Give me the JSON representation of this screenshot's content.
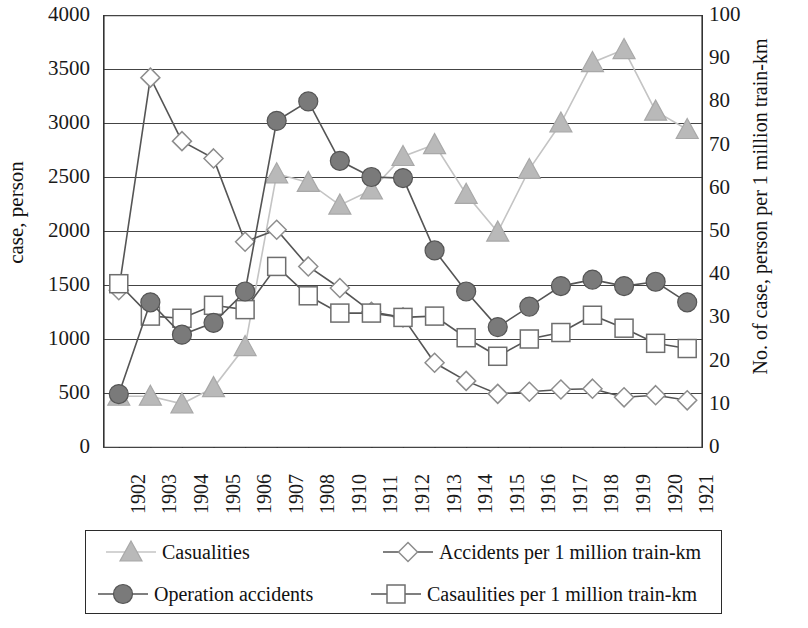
{
  "chart_data": {
    "type": "line",
    "title": "",
    "subtitle": "",
    "ylabel": "case, person",
    "y2label": "No. of case, person per 1 million train-km",
    "xlabel": "",
    "grid": true,
    "legend_position": "bottom",
    "ylim": [
      0,
      4000
    ],
    "y2lim": [
      0,
      100
    ],
    "yticks": [
      "0",
      "500",
      "1000",
      "1500",
      "2000",
      "2500",
      "3000",
      "3500",
      "4000"
    ],
    "ytick_values": [
      0,
      500,
      1000,
      1500,
      2000,
      2500,
      3000,
      3500,
      4000
    ],
    "y2ticks": [
      "0",
      "10",
      "20",
      "30",
      "40",
      "50",
      "60",
      "70",
      "80",
      "90",
      "100"
    ],
    "y2tick_values": [
      0,
      10,
      20,
      30,
      40,
      50,
      60,
      70,
      80,
      90,
      100
    ],
    "categories": [
      "1902",
      "1903",
      "1904",
      "1905",
      "1906",
      "1907",
      "1908",
      "1910",
      "1911",
      "1912",
      "1913",
      "1914",
      "1915",
      "1916",
      "1917",
      "1918",
      "1919",
      "1920",
      "1921"
    ],
    "series": [
      {
        "name": "Casualities",
        "marker": "triangle",
        "axis": "left",
        "color": "#b9b9b9",
        "values": [
          470,
          470,
          400,
          550,
          930,
          2530,
          2450,
          2240,
          2380,
          2690,
          2800,
          2340,
          1990,
          2570,
          3000,
          3560,
          3680,
          3110,
          2940
        ]
      },
      {
        "name": "Operation accidents",
        "marker": "circle",
        "axis": "left",
        "color": "#7a7a7a",
        "values": [
          490,
          1340,
          1040,
          1150,
          1440,
          3020,
          3200,
          2650,
          2500,
          2490,
          1820,
          1440,
          1110,
          1300,
          1490,
          1550,
          1490,
          1530,
          1340
        ]
      },
      {
        "name": "Accidents per 1  million train-km",
        "marker": "diamond",
        "axis": "right",
        "color": "#8d8d8d",
        "values": [
          36.3,
          85.5,
          70.8,
          66.8,
          47.5,
          50.3,
          41.8,
          36.8,
          31.3,
          30.0,
          19.5,
          15.3,
          12.3,
          12.8,
          13.3,
          13.5,
          11.5,
          12.0,
          10.8
        ]
      },
      {
        "name": "Casaulities per 1 million train-km",
        "marker": "square",
        "axis": "right",
        "color": "#6e6e6e",
        "values": [
          37.8,
          30.3,
          29.8,
          32.8,
          31.8,
          41.8,
          35.0,
          31.0,
          31.0,
          30.0,
          30.3,
          25.3,
          21.0,
          25.0,
          26.5,
          30.5,
          27.5,
          24.0,
          22.8
        ]
      }
    ]
  },
  "legend": {
    "items": [
      {
        "label": "Casualities",
        "marker": "triangle"
      },
      {
        "label": "Accidents per 1  million train-km",
        "marker": "diamond"
      },
      {
        "label": "Operation accidents",
        "marker": "circle"
      },
      {
        "label": "Casaulities per 1 million train-km",
        "marker": "square"
      }
    ]
  }
}
